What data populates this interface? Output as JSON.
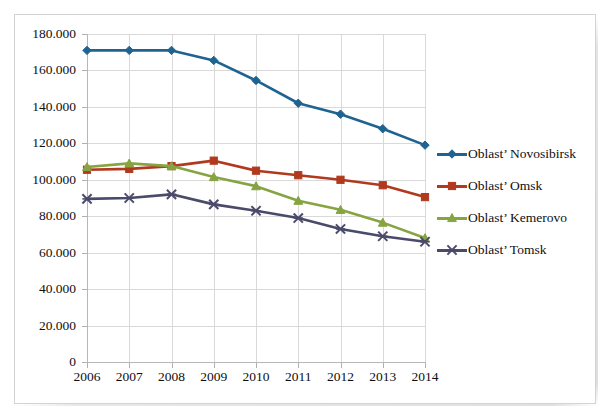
{
  "chart_data": {
    "type": "line",
    "title": "",
    "xlabel": "",
    "ylabel": "",
    "categories": [
      "2006",
      "2007",
      "2008",
      "2009",
      "2010",
      "2011",
      "2012",
      "2013",
      "2014"
    ],
    "x": [
      2006,
      2007,
      2008,
      2009,
      2010,
      2011,
      2012,
      2013,
      2014
    ],
    "ylim": [
      0,
      180000
    ],
    "ytick_values": [
      0,
      20000,
      40000,
      60000,
      80000,
      100000,
      120000,
      140000,
      160000,
      180000
    ],
    "ytick_labels": [
      "0",
      "20.000",
      "40.000",
      "60.000",
      "80.000",
      "100.000",
      "120.000",
      "140.000",
      "160.000",
      "180.000"
    ],
    "grid": true,
    "legend_position": "right",
    "series": [
      {
        "name": "Oblast’ Novosibirsk",
        "color": "#1F6391",
        "marker": "diamond",
        "values": [
          171000,
          171000,
          171000,
          165500,
          154500,
          142000,
          136000,
          128000,
          119000
        ]
      },
      {
        "name": "Oblast’ Omsk",
        "color": "#B0391E",
        "marker": "square",
        "values": [
          105500,
          106000,
          107500,
          110500,
          105000,
          102500,
          100000,
          97000,
          90500
        ]
      },
      {
        "name": "Oblast’ Kemerovo",
        "color": "#86A441",
        "marker": "triangle",
        "values": [
          107000,
          109000,
          107500,
          101500,
          96500,
          88500,
          83500,
          76500,
          68000
        ]
      },
      {
        "name": "Oblast’ Tomsk",
        "color": "#4A4A6A",
        "marker": "cross",
        "values": [
          89500,
          90000,
          92000,
          86500,
          83000,
          79000,
          73000,
          69000,
          66000
        ]
      }
    ]
  },
  "colors": {
    "gridline": "#d9d9d9",
    "axis": "#b7b7b7",
    "frame": "#d3d3d3",
    "text": "#0f0f0f",
    "background": "#ffffff"
  }
}
